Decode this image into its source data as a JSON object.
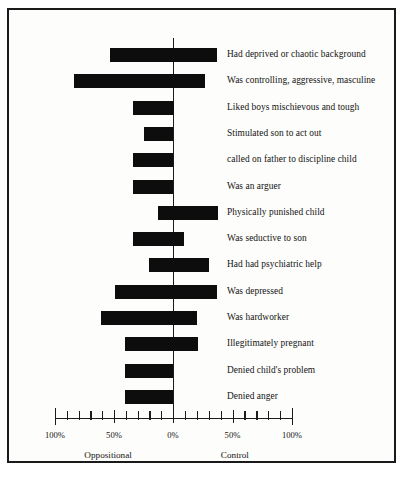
{
  "figure": {
    "background_color": "#fdfdfb",
    "border_color": "#1a1a1a",
    "bar_color": "#0d0d0d"
  },
  "chart_data": {
    "type": "bar",
    "orientation": "horizontal",
    "title": "",
    "subtitle": "",
    "xlabel": "",
    "ylabel": "",
    "xlim": [
      -100,
      100
    ],
    "grid": false,
    "legend_position": "none",
    "axis": {
      "zero_label": "0%",
      "left_end_label": "100%",
      "right_end_label": "100%",
      "left_mid_label": "50%",
      "right_mid_label": "50%",
      "tick_labels": [
        "100%",
        "50%",
        "0%",
        "50%",
        "100%"
      ],
      "tick_values": [
        -100,
        -50,
        0,
        50,
        100
      ],
      "minor_tick_interval": 10,
      "group_left": "Oppositional",
      "group_right": "Control"
    },
    "categories": [
      "Had deprived or chaotic background",
      "Was controlling, aggressive, masculine",
      "Liked boys mischievous and tough",
      "Stimulated son to act out",
      "called on father to discipline child",
      "Was an arguer",
      "Physically punished child",
      "Was seductive to son",
      "Had had psychiatric help",
      "Was depressed",
      "Was hardworker",
      "Illegitimately pregnant",
      "Denied child's problem",
      "Denied anger"
    ],
    "series": [
      {
        "name": "Oppositional",
        "side": "left",
        "values": [
          53,
          84,
          34,
          25,
          34,
          34,
          13,
          34,
          20,
          49,
          61,
          41,
          41,
          41
        ]
      },
      {
        "name": "Control",
        "side": "right",
        "values": [
          37,
          27,
          1,
          0,
          0,
          0,
          38,
          9,
          30,
          37,
          20,
          21,
          0,
          0
        ]
      }
    ]
  }
}
